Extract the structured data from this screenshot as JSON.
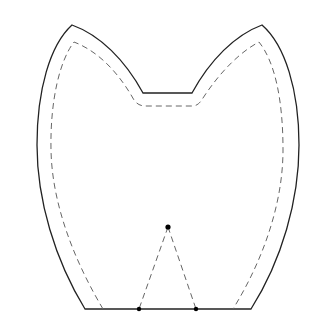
{
  "diagram": {
    "type": "sewing-pattern",
    "shape": "owl-body",
    "colors": {
      "background": "#ffffff",
      "cut_line": "#222222",
      "stitch_line": "#666666",
      "marker": "#000000"
    },
    "cut_line": {
      "style": "solid",
      "left_ear_tip": [
        72,
        25
      ],
      "right_ear_tip": [
        262,
        25
      ],
      "notch_left": [
        143,
        93
      ],
      "notch_right": [
        192,
        93
      ],
      "bottom_left": [
        85,
        309
      ],
      "bottom_right": [
        251,
        309
      ]
    },
    "stitch_line": {
      "style": "dashed",
      "notch_y": 106,
      "bottom_left_x": 103,
      "bottom_right_x": 233
    },
    "dart": {
      "style": "dashed",
      "apex": [
        168,
        227
      ],
      "base_left": [
        139,
        309
      ],
      "base_right": [
        196,
        309
      ]
    },
    "markers": [
      {
        "name": "dart-apex",
        "x": 168,
        "y": 227
      },
      {
        "name": "dart-base-left",
        "x": 139,
        "y": 309
      },
      {
        "name": "dart-base-right",
        "x": 196,
        "y": 309
      }
    ]
  }
}
